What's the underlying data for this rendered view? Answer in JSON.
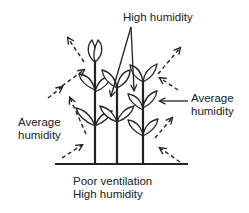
{
  "diagram": {
    "type": "illustration",
    "labels": {
      "top": [
        "High humidity"
      ],
      "right": [
        "Average",
        "humidity"
      ],
      "left": [
        "Average",
        "humidity"
      ],
      "bottom": [
        "Poor ventilation",
        "High humidity"
      ]
    },
    "elements": {
      "plants": 3,
      "airflow_arrows": "dashed, pointing outward from the canopy edges",
      "pointer_arrows": "solid, from 'High humidity' down into the dense center; from right 'Average humidity' toward the outer leaves"
    },
    "colors": {
      "ink": "#222222",
      "background": "#ffffff"
    }
  }
}
